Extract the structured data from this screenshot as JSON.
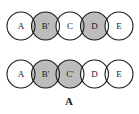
{
  "figure": {
    "caption": "A",
    "background_color": "#ffffff",
    "outline_color": "#1a1a1a",
    "shaded_fill": "#bcbcbc",
    "plain_fill": "#ffffff",
    "label_color": "#1a1a1a",
    "rows": [
      {
        "row_name": "top-chain",
        "nodes": [
          {
            "label": "A",
            "shaded": false
          },
          {
            "label": "B'",
            "shaded": true
          },
          {
            "label": "C",
            "shaded": false
          },
          {
            "label": "D",
            "shaded": true
          },
          {
            "label": "E",
            "shaded": false
          }
        ]
      },
      {
        "row_name": "bottom-chain",
        "nodes": [
          {
            "label": "A",
            "shaded": false
          },
          {
            "label": "B'",
            "shaded": true
          },
          {
            "label": "C'",
            "shaded": true
          },
          {
            "label": "D",
            "shaded": false
          },
          {
            "label": "E",
            "shaded": false
          }
        ]
      }
    ]
  }
}
